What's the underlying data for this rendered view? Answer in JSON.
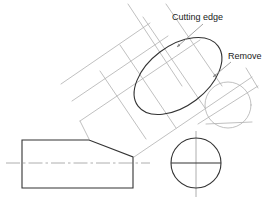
{
  "drawing": {
    "title": "Truncated inclined cylinder on rectangular base - cutting plane construction",
    "type": "engineering-orthographic-projection",
    "canvas": {
      "width": 275,
      "height": 203,
      "background": "#ffffff"
    },
    "colors": {
      "object_line": "#333333",
      "construction_line": "#b0b0b0",
      "center_line": "#9a9a9a",
      "leader_line": "#8a8a8a",
      "text": "#1a1a1a"
    },
    "annotations": [
      {
        "id": "cutting-edge",
        "label": "Cutting edge",
        "text_x": 172,
        "text_y": 20,
        "leader": {
          "x1": 202,
          "y1": 24,
          "x2": 176,
          "y2": 47
        },
        "arrow": {
          "x": 176,
          "y": 47
        }
      },
      {
        "id": "remove",
        "label": "Remove",
        "text_x": 228,
        "text_y": 59,
        "leader": {
          "x1": 230,
          "y1": 62,
          "x2": 212,
          "y2": 77
        },
        "arrow": {
          "x": 212,
          "y": 77
        }
      }
    ],
    "shapes": {
      "base_block": {
        "name": "rectangular-base-block",
        "left": 22,
        "top": 140,
        "right": 133,
        "bottom": 188,
        "chamfer_start_x": 89,
        "chamfer_end_y": 157
      },
      "base_centerline": {
        "x1": 6,
        "y1": 163,
        "x2": 150,
        "y2": 163
      },
      "front_circle": {
        "name": "end-view-circle",
        "cx": 196,
        "cy": 163,
        "r": 25,
        "diameter_line_y": 163
      },
      "front_circle_centerline_v": {
        "x1": 196,
        "y1": 132,
        "x2": 196,
        "y2": 196
      },
      "inclined_cylinder": {
        "name": "inclined-cylinder-body",
        "axis_angle_deg": -45,
        "edge_a": {
          "x1": 80,
          "y1": 121,
          "x2": 198,
          "y2": 41
        },
        "edge_b": {
          "x1": 134,
          "y1": 157,
          "x2": 250,
          "y2": 78
        }
      },
      "end_circle": {
        "name": "inclined-end-circle",
        "cx": 228,
        "cy": 105,
        "r": 23
      },
      "cut_ellipse": {
        "name": "cutting-plane-ellipse",
        "cx": 178,
        "cy": 76,
        "rx": 50,
        "ry": 30,
        "rotation_deg": -37
      }
    }
  }
}
